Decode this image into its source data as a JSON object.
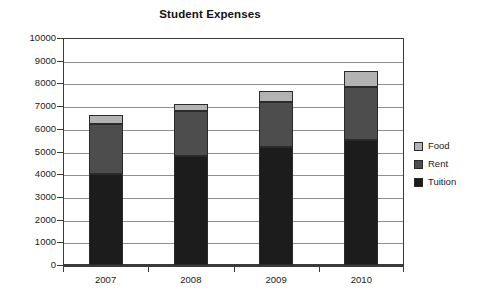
{
  "chart_data": {
    "type": "bar",
    "subtype": "stacked-bar",
    "title": "Student Expenses",
    "xlabel": "",
    "ylabel": "",
    "categories": [
      "2007",
      "2008",
      "2009",
      "2010"
    ],
    "series": [
      {
        "name": "Tuition",
        "values": [
          4000,
          4800,
          5200,
          5500
        ],
        "color": "#1c1c1c"
      },
      {
        "name": "Rent",
        "values": [
          2200,
          2000,
          2000,
          2350
        ],
        "color": "#4d4d4d"
      },
      {
        "name": "Food",
        "values": [
          400,
          300,
          450,
          700
        ],
        "color": "#b3b3b3"
      }
    ],
    "totals": [
      6600,
      7100,
      7650,
      8550
    ],
    "ylim": [
      0,
      10000
    ],
    "ytick_step": 1000,
    "ytick_labels": [
      "10000",
      "9000",
      "8000",
      "7000",
      "6000",
      "5000",
      "4000",
      "3000",
      "2000",
      "1000",
      "0"
    ],
    "ytick_values": [
      10000,
      9000,
      8000,
      7000,
      6000,
      5000,
      4000,
      3000,
      2000,
      1000,
      0
    ],
    "grid": true,
    "grid_axis": "y",
    "legend_position": "right",
    "legend_entries": [
      "Food",
      "Rent",
      "Tuition"
    ],
    "plot_background": "#ffffff",
    "grid_color": "#8f8f8f",
    "axis_color": "#3a3a3a"
  }
}
